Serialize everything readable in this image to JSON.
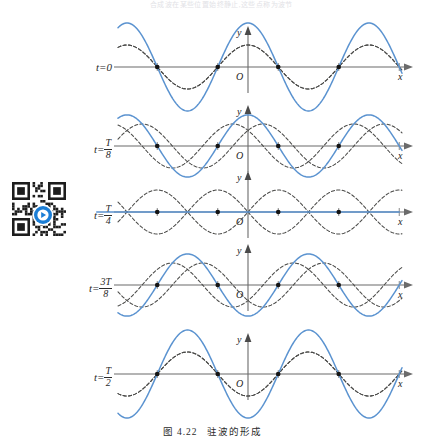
{
  "figure": {
    "caption_number": "图 4.22",
    "caption_text": "驻波的形成",
    "top_faint_text": "合成波在某些位置始终静止,这些点称为波节",
    "qr_icon": "qr-code-with-play-button",
    "axis_labels": {
      "x": "x",
      "y": "y",
      "origin": "O"
    },
    "colors": {
      "resultant": "#5b93d0",
      "component": "#4a4a48",
      "axis": "#6b6b6b",
      "node": "#141414",
      "qr_accent": "#1b7ed6"
    }
  },
  "panels": [
    {
      "id": "panel-t0",
      "label_t": "t",
      "label_eq": "=",
      "label_value": "0",
      "label_is_fraction": false,
      "time": "0",
      "phase_deg": 0,
      "resultant_amplitude": 2.0,
      "resultant_flat": false,
      "components_coincide": true,
      "nodes_visible": true
    },
    {
      "id": "panel-t-over-8",
      "label_t": "t",
      "label_eq": "=",
      "label_num": "T",
      "label_den": "8",
      "label_is_fraction": true,
      "time": "T/8",
      "phase_deg": 45,
      "resultant_amplitude": 1.414,
      "resultant_flat": false,
      "components_coincide": false,
      "nodes_visible": true
    },
    {
      "id": "panel-t-over-4",
      "label_t": "t",
      "label_eq": "=",
      "label_num": "T",
      "label_den": "4",
      "label_is_fraction": true,
      "time": "T/4",
      "phase_deg": 90,
      "resultant_amplitude": 0.0,
      "resultant_flat": true,
      "components_coincide": false,
      "nodes_visible": true
    },
    {
      "id": "panel-3t-over-8",
      "label_t": "t",
      "label_eq": "=",
      "label_num": "3T",
      "label_den": "8",
      "label_is_fraction": true,
      "time": "3T/8",
      "phase_deg": 135,
      "resultant_amplitude": 1.414,
      "resultant_flat": false,
      "components_coincide": false,
      "nodes_visible": true
    },
    {
      "id": "panel-t-over-2",
      "label_t": "t",
      "label_eq": "=",
      "label_num": "T",
      "label_den": "2",
      "label_is_fraction": true,
      "time": "T/2",
      "phase_deg": 180,
      "resultant_amplitude": 2.0,
      "resultant_flat": false,
      "components_coincide": true,
      "nodes_visible": true
    }
  ],
  "chart_data": {
    "type": "line",
    "title": "驻波的形成",
    "xlabel": "x",
    "ylabel": "y",
    "x_range": [
      -1.55,
      1.55
    ],
    "wavelength": 1.0,
    "component_amplitude": 1.0,
    "node_positions_x": [
      -1.25,
      -0.75,
      -0.25,
      0.25,
      0.75,
      1.25
    ],
    "node_marker_positions_x": [
      -0.75,
      -0.25,
      0.25,
      0.75
    ],
    "antinode_positions_x": [
      -1.0,
      -0.5,
      0.0,
      0.5,
      1.0
    ],
    "tick_positions_x": [
      -1.25,
      -0.75,
      -0.25,
      0.25,
      0.75,
      1.25
    ],
    "series": [
      {
        "name": "右行波 (rightward component)",
        "style": "dashed",
        "color": "#4a4a48",
        "amplitude": 1.0
      },
      {
        "name": "左行波 (leftward component)",
        "style": "dashed",
        "color": "#4a4a48",
        "amplitude": 1.0
      },
      {
        "name": "合成驻波 (resultant standing wave)",
        "style": "solid",
        "color": "#5b93d0",
        "amplitude_factor": 2.0
      }
    ],
    "snapshots": [
      {
        "t": "0",
        "resultant_amplitude": 2.0,
        "component_phase_shift": 0.0
      },
      {
        "t": "T/8",
        "resultant_amplitude": 1.414,
        "component_phase_shift": 0.125
      },
      {
        "t": "T/4",
        "resultant_amplitude": 0.0,
        "component_phase_shift": 0.25
      },
      {
        "t": "3T/8",
        "resultant_amplitude": 1.414,
        "component_phase_shift": 0.375
      },
      {
        "t": "T/2",
        "resultant_amplitude": 2.0,
        "component_phase_shift": 0.5
      }
    ],
    "grid": false,
    "legend": "none"
  }
}
